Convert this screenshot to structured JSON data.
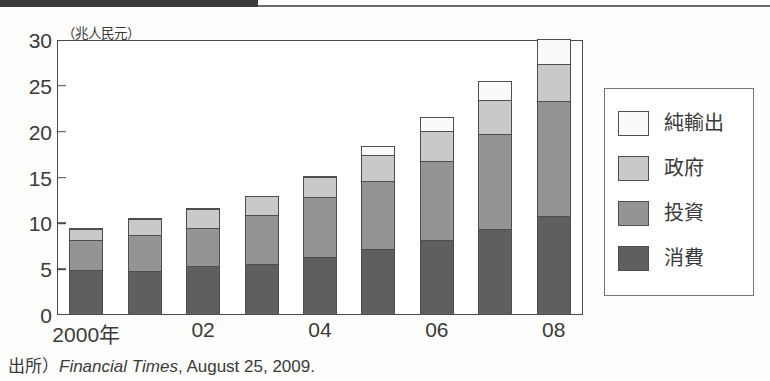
{
  "figure": {
    "y_axis_unit": "（兆人民元）",
    "source_prefix": "出所）",
    "source_italic": "Financial Times",
    "source_rest": ", August 25, 2009."
  },
  "legend": {
    "items": [
      {
        "label": "純輸出",
        "color": "#fafafa",
        "key": "net-exports"
      },
      {
        "label": "政府",
        "color": "#c9c9c9",
        "key": "government"
      },
      {
        "label": "投資",
        "color": "#949494",
        "key": "investment"
      },
      {
        "label": "消費",
        "color": "#5f5f5f",
        "key": "consumption"
      }
    ]
  },
  "chart_data": {
    "type": "bar",
    "stacked": true,
    "title": "",
    "subtitle": "",
    "xlabel": "",
    "ylabel": "（兆人民元）",
    "ylim": [
      0,
      30
    ],
    "yticks": [
      0,
      5,
      10,
      15,
      20,
      25,
      30
    ],
    "ytick_labels": [
      "0",
      "5",
      "10",
      "15",
      "20",
      "25",
      "30"
    ],
    "grid": false,
    "legend_position": "right",
    "categories": [
      "2000",
      "2001",
      "2002",
      "2003",
      "2004",
      "2005",
      "2006",
      "2007",
      "2008"
    ],
    "xtick_labels": [
      "2000年",
      "",
      "02",
      "",
      "04",
      "",
      "06",
      "",
      "08"
    ],
    "series": [
      {
        "name": "消費",
        "key": "consumption",
        "color": "#5f5f5f",
        "values": [
          4.9,
          4.8,
          5.4,
          5.6,
          6.3,
          7.2,
          8.2,
          9.4,
          10.8
        ]
      },
      {
        "name": "投資",
        "key": "investment",
        "color": "#949494",
        "values": [
          3.3,
          3.9,
          4.1,
          5.3,
          6.6,
          7.4,
          8.6,
          10.3,
          12.6
        ]
      },
      {
        "name": "政府",
        "key": "government",
        "color": "#c9c9c9",
        "values": [
          1.2,
          1.8,
          2.1,
          2.1,
          2.2,
          2.9,
          3.3,
          3.8,
          4.0
        ]
      },
      {
        "name": "純輸出",
        "key": "net-exports",
        "color": "#fafafa",
        "values": [
          0.1,
          0.1,
          0.1,
          0.0,
          0.1,
          0.9,
          1.5,
          2.0,
          2.7
        ]
      }
    ],
    "totals": [
      9.5,
      10.6,
      11.7,
      13.0,
      15.2,
      18.4,
      21.6,
      25.5,
      30.1
    ]
  }
}
